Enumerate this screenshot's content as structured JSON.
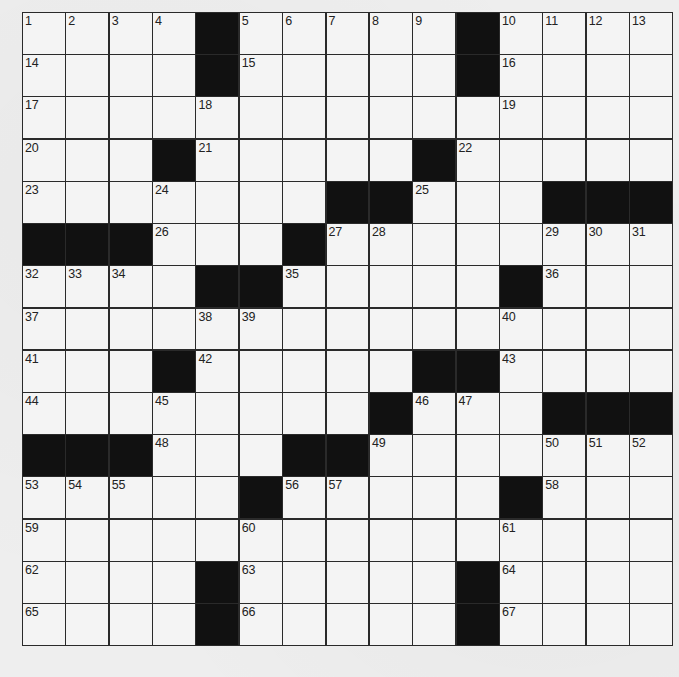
{
  "puzzle": {
    "rows": 15,
    "cols": 15,
    "colors": {
      "background": "#eeeeee",
      "cell": "#f4f4f4",
      "block": "#111111",
      "line": "#2a2a2a",
      "number": "#222222"
    },
    "layout": [
      [
        "1",
        "2",
        "3",
        "4",
        "#",
        "5",
        "6",
        "7",
        "8",
        "9",
        "#",
        "10",
        "11",
        "12",
        "13"
      ],
      [
        "14",
        "",
        "",
        "",
        "#",
        "15",
        "",
        "",
        "",
        "",
        "#",
        "16",
        "",
        "",
        ""
      ],
      [
        "17",
        "",
        "",
        "",
        "18",
        "",
        "",
        "",
        "",
        "",
        "",
        "19",
        "",
        "",
        ""
      ],
      [
        "20",
        "",
        "",
        "#",
        "21",
        "",
        "",
        "",
        "",
        "#",
        "22",
        "",
        "",
        "",
        ""
      ],
      [
        "23",
        "",
        "",
        "24",
        "",
        "",
        "",
        "#",
        "#",
        "25",
        "",
        "",
        "#",
        "#",
        "#"
      ],
      [
        "#",
        "#",
        "#",
        "26",
        "",
        "",
        "#",
        "27",
        "28",
        "",
        "",
        "",
        "29",
        "30",
        "31"
      ],
      [
        "32",
        "33",
        "34",
        "",
        "#",
        "#",
        "35",
        "",
        "",
        "",
        "",
        "#",
        "36",
        "",
        ""
      ],
      [
        "37",
        "",
        "",
        "",
        "38",
        "39",
        "",
        "",
        "",
        "",
        "",
        "40",
        "",
        "",
        ""
      ],
      [
        "41",
        "",
        "",
        "#",
        "42",
        "",
        "",
        "",
        "",
        "#",
        "#",
        "43",
        "",
        "",
        ""
      ],
      [
        "44",
        "",
        "",
        "45",
        "",
        "",
        "",
        "",
        "#",
        "46",
        "47",
        "",
        "#",
        "#",
        "#"
      ],
      [
        "#",
        "#",
        "#",
        "48",
        "",
        "",
        "#",
        "#",
        "49",
        "",
        "",
        "",
        "50",
        "51",
        "52"
      ],
      [
        "53",
        "54",
        "55",
        "",
        "",
        "#",
        "56",
        "57",
        "",
        "",
        "",
        "#",
        "58",
        "",
        ""
      ],
      [
        "59",
        "",
        "",
        "",
        "",
        "60",
        "",
        "",
        "",
        "",
        "",
        "61",
        "",
        "",
        ""
      ],
      [
        "62",
        "",
        "",
        "",
        "#",
        "63",
        "",
        "",
        "",
        "",
        "#",
        "64",
        "",
        "",
        ""
      ],
      [
        "65",
        "",
        "",
        "",
        "#",
        "66",
        "",
        "",
        "",
        "",
        "#",
        "67",
        "",
        "",
        ""
      ]
    ]
  }
}
